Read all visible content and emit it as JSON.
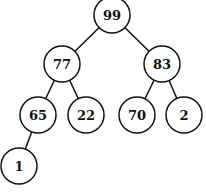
{
  "diagram": {
    "type": "binary-tree (max-heap)",
    "nodes": [
      {
        "id": "n99",
        "label": "99",
        "x": 112,
        "y": 15
      },
      {
        "id": "n77",
        "label": "77",
        "x": 62,
        "y": 64
      },
      {
        "id": "n83",
        "label": "83",
        "x": 162,
        "y": 64
      },
      {
        "id": "n65",
        "label": "65",
        "x": 38,
        "y": 115
      },
      {
        "id": "n22",
        "label": "22",
        "x": 86,
        "y": 115
      },
      {
        "id": "n70",
        "label": "70",
        "x": 137,
        "y": 115
      },
      {
        "id": "n2",
        "label": "2",
        "x": 184,
        "y": 115
      },
      {
        "id": "n1",
        "label": "1",
        "x": 19,
        "y": 166
      }
    ],
    "edges": [
      [
        "n99",
        "n77"
      ],
      [
        "n99",
        "n83"
      ],
      [
        "n77",
        "n65"
      ],
      [
        "n77",
        "n22"
      ],
      [
        "n83",
        "n70"
      ],
      [
        "n83",
        "n2"
      ],
      [
        "n65",
        "n1"
      ]
    ],
    "node_radius": 18
  }
}
